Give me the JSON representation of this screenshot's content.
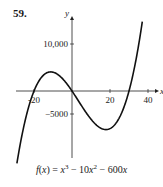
{
  "problem_number": "59.",
  "caption": "f(x) = x³ − 10x² − 600x",
  "chart_data": {
    "type": "line",
    "title": "",
    "function": "f(x) = x^3 - 10x^2 - 600x",
    "xlabel": "x",
    "ylabel": "y",
    "x_ticks": [
      -20,
      20,
      40
    ],
    "y_ticks": [
      10000,
      -5000
    ],
    "x_tick_labels": [
      "-20",
      "20",
      "40"
    ],
    "y_tick_labels": [
      "10,000",
      "-5000"
    ],
    "xlim": [
      -29,
      40
    ],
    "ylim": [
      -15400,
      15000
    ],
    "grid": false,
    "legend": null,
    "series": [
      {
        "name": "f(x)",
        "x": [
          -29,
          -25,
          -20,
          -15,
          -11.2,
          -5,
          0,
          5,
          10,
          17.9,
          25,
          30,
          35,
          37
        ],
        "y": [
          -15399,
          -6250,
          0,
          3375,
          4061,
          2625,
          0,
          -3125,
          -6000,
          -8209,
          -6125,
          0,
          10500,
          14689
        ]
      }
    ],
    "roots": [
      -20,
      0,
      30
    ],
    "local_max": [
      -11.2,
      4061
    ],
    "local_min": [
      17.9,
      -8209
    ]
  },
  "axis": {
    "x_label": "x",
    "y_label": "y",
    "tick_x_neg20": "-20",
    "tick_x_20": "20",
    "tick_x_40": "40",
    "tick_y_10000": "10,000",
    "tick_y_neg5000": "−5000"
  }
}
